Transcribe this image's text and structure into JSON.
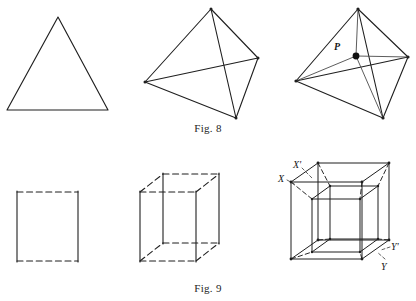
{
  "page": {
    "background_color": "#ffffff",
    "ink_color": "#1a1a1a",
    "width": 416,
    "height": 301
  },
  "captions": {
    "fig8": "Fig. 8",
    "fig9": "Fig. 9"
  },
  "labels": {
    "p": "P",
    "x": "X",
    "x_prime": "X'",
    "y": "Y",
    "y_prime": "Y'"
  },
  "figures": {
    "fig8": {
      "caption": "Fig. 8",
      "row": "top",
      "panels": [
        {
          "name": "triangle",
          "description": "equilateral triangle outline",
          "vertices": [
            [
              58,
              17
            ],
            [
              7,
              110
            ],
            [
              108,
              110
            ]
          ],
          "edges": [
            [
              0,
              1
            ],
            [
              1,
              2
            ],
            [
              2,
              0
            ]
          ],
          "style": "solid"
        },
        {
          "name": "tetrahedron",
          "description": "tetrahedron in oblique projection, all six edges solid",
          "vertices": [
            [
              211,
              9
            ],
            [
              145,
              82
            ],
            [
              258,
              58
            ],
            [
              236,
              118
            ]
          ],
          "edges": [
            [
              0,
              1
            ],
            [
              0,
              2
            ],
            [
              0,
              3
            ],
            [
              1,
              2
            ],
            [
              1,
              3
            ],
            [
              2,
              3
            ]
          ],
          "style": "solid"
        },
        {
          "name": "tetrahedron-with-interior-point",
          "description": "tetrahedron with interior point P joined to all four vertices",
          "vertices": [
            [
              358,
              9
            ],
            [
              296,
              81
            ],
            [
              408,
              57
            ],
            [
              383,
              118
            ]
          ],
          "edges": [
            [
              0,
              1
            ],
            [
              0,
              2
            ],
            [
              0,
              3
            ],
            [
              1,
              2
            ],
            [
              1,
              3
            ],
            [
              2,
              3
            ]
          ],
          "interior_point": {
            "label": "P",
            "position": [
              356,
              56
            ],
            "radius": 3.4
          },
          "point_edges": [
            [
              0
            ],
            [
              1
            ],
            [
              2
            ],
            [
              3
            ]
          ],
          "style": "solid"
        }
      ]
    },
    "fig9": {
      "caption": "Fig. 9",
      "row": "bottom",
      "panels": [
        {
          "name": "square",
          "description": "square with dashed horizontal edges and solid vertical edges",
          "vertices": [
            [
              17,
              192
            ],
            [
              78,
              192
            ],
            [
              78,
              261
            ],
            [
              17,
              261
            ]
          ],
          "dashed_edges": [
            [
              0,
              1
            ],
            [
              3,
              2
            ]
          ],
          "solid_edges": [
            [
              0,
              3
            ],
            [
              1,
              2
            ]
          ]
        },
        {
          "name": "cube",
          "description": "cube in oblique projection; vertical edges solid, horizontal edges dashed",
          "front_face": [
            [
              140,
              192
            ],
            [
              196,
              192
            ],
            [
              196,
              261
            ],
            [
              140,
              261
            ]
          ],
          "back_face": [
            [
              163,
              174
            ],
            [
              219,
              174
            ],
            [
              219,
              243
            ],
            [
              163,
              243
            ]
          ],
          "solid_edges": [
            "front-left-vertical",
            "front-right-vertical",
            "back-left-vertical",
            "back-right-vertical"
          ],
          "dashed_edges": [
            "top-horizontals",
            "bottom-horizontals",
            "depth-connectors"
          ]
        },
        {
          "name": "tesseract",
          "description": "hypercube (tesseract) projection: outer cube, inner cube, and diagonal connectors; corners labelled X, X prime, Y, Y prime",
          "outer_front": [
            [
              291,
              182
            ],
            [
              362,
              182
            ],
            [
              362,
              259
            ],
            [
              291,
              259
            ]
          ],
          "outer_back": [
            [
              318,
              163
            ],
            [
              389,
              163
            ],
            [
              389,
              240
            ],
            [
              318,
              240
            ]
          ],
          "inner_front": [
            [
              312,
              199
            ],
            [
              360,
              199
            ],
            [
              360,
              252
            ],
            [
              312,
              252
            ]
          ],
          "inner_back": [
            [
              330,
              186
            ],
            [
              378,
              186
            ],
            [
              378,
              239
            ],
            [
              330,
              239
            ]
          ],
          "labels": [
            {
              "text": "X'",
              "position": [
                293,
                159
              ],
              "anchor": [
                312,
                176
              ]
            },
            {
              "text": "X",
              "position": [
                278,
                173
              ],
              "anchor": [
                295,
                184
              ]
            },
            {
              "text": "Y'",
              "position": [
                391,
                241
              ],
              "anchor": [
                379,
                251
              ]
            },
            {
              "text": "Y",
              "position": [
                381,
                261
              ],
              "anchor": [
                372,
                256
              ]
            }
          ]
        }
      ]
    }
  }
}
